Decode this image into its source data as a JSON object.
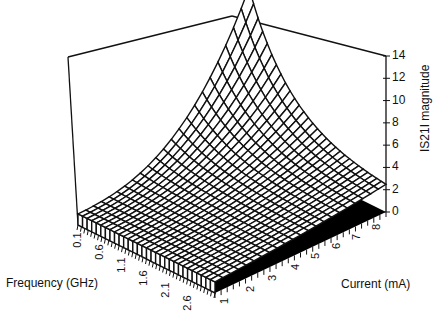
{
  "chart_data": {
    "type": "surface3d",
    "title": "",
    "xlabel": "Frequency  (GHz)",
    "ylabel": "Current   (mA)",
    "zlabel": "IS21I  magnitude",
    "x_ticks": [
      "0.1",
      "0.6",
      "1.1",
      "1.6",
      "2.1",
      "2.6"
    ],
    "y_ticks": [
      "1",
      "2",
      "3",
      "4",
      "5",
      "6",
      "7",
      "8"
    ],
    "z_ticks": [
      "0",
      "2",
      "4",
      "6",
      "8",
      "10",
      "12",
      "14"
    ],
    "zlim": [
      0,
      14
    ],
    "x_range_ghz": [
      0.1,
      3.0
    ],
    "y_range_ma": [
      1,
      8
    ],
    "grid": false,
    "legend": null,
    "surface_description": "Wireframe mesh; |S21| is largest (~14) at low frequency and high current at the back corner, decreasing with frequency to ~1-2 near 2.6-3 GHz across all currents.",
    "sample_points": [
      {
        "freq_ghz": 0.1,
        "current_ma": 1,
        "s21": 5.5
      },
      {
        "freq_ghz": 0.1,
        "current_ma": 8,
        "s21": 14.0
      },
      {
        "freq_ghz": 1.1,
        "current_ma": 1,
        "s21": 3.5
      },
      {
        "freq_ghz": 1.1,
        "current_ma": 8,
        "s21": 7.0
      },
      {
        "freq_ghz": 2.1,
        "current_ma": 1,
        "s21": 2.0
      },
      {
        "freq_ghz": 2.1,
        "current_ma": 8,
        "s21": 3.5
      },
      {
        "freq_ghz": 3.0,
        "current_ma": 1,
        "s21": 1.0
      },
      {
        "freq_ghz": 3.0,
        "current_ma": 8,
        "s21": 2.0
      }
    ],
    "colors": {
      "mesh": "#111111",
      "floor": "#000000",
      "background": "#ffffff"
    }
  },
  "caption_partial": "Figure ... Magnitude |S21| as a function of frequency and current (cut off)"
}
